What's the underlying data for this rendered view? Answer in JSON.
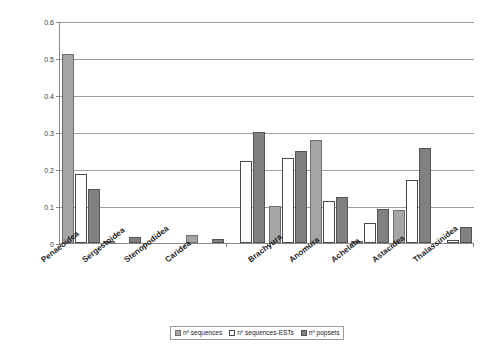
{
  "chart_data": {
    "type": "bar",
    "title": "",
    "subtitle": "",
    "xlabel": "",
    "ylabel": "",
    "ylim": [
      0,
      0.6
    ],
    "ytick_labels": [
      "0",
      "0.1",
      "0.2",
      "0.3",
      "0.4",
      "0.5",
      "0.6"
    ],
    "ytick_values": [
      0,
      0.1,
      0.2,
      0.3,
      0.4,
      0.5,
      0.6
    ],
    "grid": true,
    "grid_axis": "y",
    "legend_position": "bottom",
    "categories": [
      "Penaeoidea",
      "Sergestoidea",
      "Stenopodidea",
      "Caridea",
      "Brachyura",
      "Anomura",
      "Achelata",
      "Astacidea",
      "Thalassinidea"
    ],
    "series": [
      {
        "name": "nº sequences",
        "color": "#a6a6a6",
        "values": [
          0.51,
          0.002,
          0.0,
          0.022,
          0.101,
          0.279,
          0.002,
          0.088,
          0.0
        ]
      },
      {
        "name": "nº sequences-ESTs",
        "color": "#ffffff",
        "values": [
          0.186,
          0.0,
          0.0,
          0.0,
          0.23,
          0.113,
          0.053,
          0.17,
          0.007
        ]
      },
      {
        "name": "nº popsets",
        "color": "#808080",
        "values": [
          0.147,
          0.016,
          0.0,
          0.011,
          0.248,
          0.124,
          0.091,
          0.256,
          0.043
        ]
      }
    ],
    "extra_group": {
      "note_visible_between": "Caridea and Brachyura",
      "values": [
        0.0,
        0.221,
        0.299
      ]
    }
  },
  "legend": {
    "items": [
      {
        "label": "nº sequences"
      },
      {
        "label": "nº sequences-ESTs"
      },
      {
        "label": "nº popsets"
      }
    ]
  },
  "axis": {
    "y_ticks": [
      "0.6",
      "0.5",
      "0.4",
      "0.3",
      "0.2",
      "0.1",
      "0"
    ]
  }
}
